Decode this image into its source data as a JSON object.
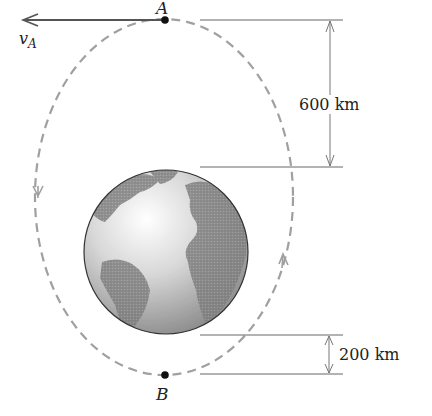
{
  "diagram": {
    "points": {
      "A": {
        "label": "A"
      },
      "B": {
        "label": "B"
      }
    },
    "velocity": {
      "symbol": "v",
      "subscript": "A"
    },
    "dimensions": {
      "apogee_altitude": "600 km",
      "perigee_altitude": "200 km"
    },
    "colors": {
      "orbit": "#9a9a9a",
      "lines": "#555555",
      "earth_ocean": "#e6e6e6",
      "earth_land": "#8c8c8c"
    }
  }
}
